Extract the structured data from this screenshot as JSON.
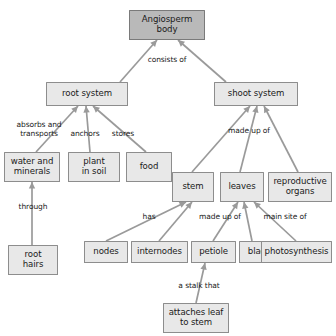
{
  "diagram": {
    "title_fragment": "",
    "palette": {
      "root_fill": "#b9b9b9",
      "node_fill": "#e8e8e8",
      "node_stroke": "#8d8d8d",
      "edge_stroke": "#9a9a9a",
      "text": "#1a1a1a",
      "background": "#ffffff"
    },
    "nodes": [
      {
        "id": "angiosperm-body",
        "label": "Angiosperm\nbody",
        "x": 129,
        "y": 10,
        "w": 76,
        "h": 30,
        "root": true
      },
      {
        "id": "root-system",
        "label": "root system",
        "x": 46,
        "y": 82,
        "w": 82,
        "h": 24,
        "root": false
      },
      {
        "id": "shoot-system",
        "label": "shoot system",
        "x": 214,
        "y": 82,
        "w": 84,
        "h": 24,
        "root": false
      },
      {
        "id": "water-and-minerals",
        "label": "water and\nminerals",
        "x": 4,
        "y": 152,
        "w": 56,
        "h": 30,
        "root": false
      },
      {
        "id": "plant-in-soil",
        "label": "plant\nin soil",
        "x": 68,
        "y": 152,
        "w": 52,
        "h": 30,
        "root": false
      },
      {
        "id": "food",
        "label": "food",
        "x": 126,
        "y": 152,
        "w": 46,
        "h": 30,
        "root": false
      },
      {
        "id": "root-hairs",
        "label": "root\nhairs",
        "x": 8,
        "y": 245,
        "w": 50,
        "h": 30,
        "root": false
      },
      {
        "id": "stem",
        "label": "stem",
        "x": 172,
        "y": 172,
        "w": 42,
        "h": 30,
        "root": false
      },
      {
        "id": "leaves",
        "label": "leaves",
        "x": 220,
        "y": 172,
        "w": 44,
        "h": 30,
        "root": false
      },
      {
        "id": "reproductive-organs",
        "label": "reproductive\norgans",
        "x": 268,
        "y": 172,
        "w": 64,
        "h": 30,
        "root": false
      },
      {
        "id": "nodes",
        "label": "nodes",
        "x": 84,
        "y": 241,
        "w": 44,
        "h": 22,
        "root": false
      },
      {
        "id": "internodes",
        "label": "internodes",
        "x": 131,
        "y": 241,
        "w": 57,
        "h": 22,
        "root": false
      },
      {
        "id": "petiole",
        "label": "petiole",
        "x": 191,
        "y": 241,
        "w": 45,
        "h": 22,
        "root": false
      },
      {
        "id": "blade",
        "label": "blade",
        "x": 239,
        "y": 241,
        "w": 41,
        "h": 22,
        "root": false
      },
      {
        "id": "photosynthesis",
        "label": "photosynthesis",
        "x": 261,
        "y": 241,
        "w": 71,
        "h": 22,
        "root": false
      },
      {
        "id": "attaches-leaf-to-stem",
        "label": "attaches leaf\nto stem",
        "x": 163,
        "y": 303,
        "w": 66,
        "h": 30,
        "root": false
      }
    ],
    "edges": [
      {
        "id": "body-to-root-system",
        "from": "angiosperm-body",
        "to": "root-system",
        "x1": 157,
        "y1": 40,
        "x2": 120,
        "y2": 82,
        "arrow": true
      },
      {
        "id": "body-to-shoot-system",
        "from": "angiosperm-body",
        "to": "shoot-system",
        "x1": 178,
        "y1": 40,
        "x2": 226,
        "y2": 82,
        "arrow": true
      },
      {
        "id": "root-system-to-water",
        "from": "root-system",
        "to": "water-and-minerals",
        "x1": 78,
        "y1": 106,
        "x2": 36,
        "y2": 152,
        "arrow": true
      },
      {
        "id": "root-system-to-plant",
        "from": "root-system",
        "to": "plant-in-soil",
        "x1": 86,
        "y1": 106,
        "x2": 90,
        "y2": 152,
        "arrow": true
      },
      {
        "id": "root-system-to-food",
        "from": "root-system",
        "to": "food",
        "x1": 93,
        "y1": 106,
        "x2": 146,
        "y2": 152,
        "arrow": true
      },
      {
        "id": "water-to-root-hairs",
        "from": "water-and-minerals",
        "to": "root-hairs",
        "x1": 32,
        "y1": 182,
        "x2": 32,
        "y2": 245,
        "arrow": true
      },
      {
        "id": "shoot-system-to-stem",
        "from": "shoot-system",
        "to": "stem",
        "x1": 250,
        "y1": 106,
        "x2": 192,
        "y2": 172,
        "arrow": true
      },
      {
        "id": "shoot-system-to-leaves",
        "from": "shoot-system",
        "to": "leaves",
        "x1": 257,
        "y1": 106,
        "x2": 240,
        "y2": 172,
        "arrow": true
      },
      {
        "id": "shoot-system-to-reproductive",
        "from": "shoot-system",
        "to": "reproductive-organs",
        "x1": 264,
        "y1": 106,
        "x2": 298,
        "y2": 172,
        "arrow": true
      },
      {
        "id": "stem-to-nodes",
        "from": "stem",
        "to": "nodes",
        "x1": 186,
        "y1": 202,
        "x2": 106,
        "y2": 241,
        "arrow": true
      },
      {
        "id": "stem-to-internodes",
        "from": "stem",
        "to": "internodes",
        "x1": 192,
        "y1": 202,
        "x2": 159,
        "y2": 241,
        "arrow": true
      },
      {
        "id": "leaves-to-petiole",
        "from": "leaves",
        "to": "petiole",
        "x1": 238,
        "y1": 202,
        "x2": 213,
        "y2": 241,
        "arrow": true
      },
      {
        "id": "leaves-to-blade",
        "from": "leaves",
        "to": "blade",
        "x1": 244,
        "y1": 202,
        "x2": 252,
        "y2": 241,
        "arrow": true
      },
      {
        "id": "leaves-to-photosynthesis",
        "from": "leaves",
        "to": "photosynthesis",
        "x1": 254,
        "y1": 202,
        "x2": 296,
        "y2": 241,
        "arrow": true
      },
      {
        "id": "petiole-to-attaches",
        "from": "petiole",
        "to": "attaches-leaf-to-stem",
        "x1": 205,
        "y1": 263,
        "x2": 196,
        "y2": 303,
        "arrow": true
      }
    ],
    "edge_labels": [
      {
        "id": "consists-of",
        "text": "consists of",
        "x": 132,
        "y": 56,
        "w": 70
      },
      {
        "id": "absorbs-and-transports",
        "text": "absorbs and\ntransports",
        "x": 6,
        "y": 121,
        "w": 66
      },
      {
        "id": "anchors",
        "text": "anchors",
        "x": 66,
        "y": 130,
        "w": 38
      },
      {
        "id": "stores",
        "text": "stores",
        "x": 106,
        "y": 130,
        "w": 34
      },
      {
        "id": "through",
        "text": "through",
        "x": 12,
        "y": 203,
        "w": 42
      },
      {
        "id": "made-up-of-shoot",
        "text": "made up of",
        "x": 219,
        "y": 127,
        "w": 60
      },
      {
        "id": "has",
        "text": "has",
        "x": 138,
        "y": 213,
        "w": 22
      },
      {
        "id": "made-up-of-leaves",
        "text": "made up of",
        "x": 191,
        "y": 213,
        "w": 58
      },
      {
        "id": "main-site-of",
        "text": "main site of",
        "x": 256,
        "y": 213,
        "w": 58
      },
      {
        "id": "a-stalk-that",
        "text": "a stalk that",
        "x": 171,
        "y": 282,
        "w": 56
      }
    ]
  }
}
